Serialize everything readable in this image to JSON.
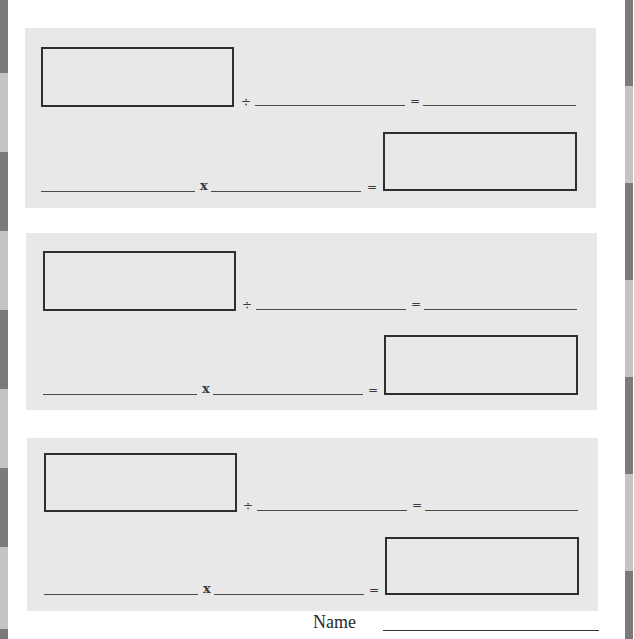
{
  "worksheet": {
    "panels": [
      {
        "operators": {
          "divide": "÷",
          "equals1": "=",
          "times": "x",
          "equals2": "="
        }
      },
      {
        "operators": {
          "divide": "÷",
          "equals1": "=",
          "times": "x",
          "equals2": "="
        }
      },
      {
        "operators": {
          "divide": "÷",
          "equals1": "=",
          "times": "x",
          "equals2": "="
        }
      }
    ],
    "name_label": "Name",
    "name_value": ""
  },
  "colors": {
    "panel_bg": "#e8e8e8",
    "edge_dark": "#7a7a7a",
    "edge_light": "#c4c4c4",
    "line": "#4a4a4a",
    "box_border": "#2f2f2f"
  }
}
